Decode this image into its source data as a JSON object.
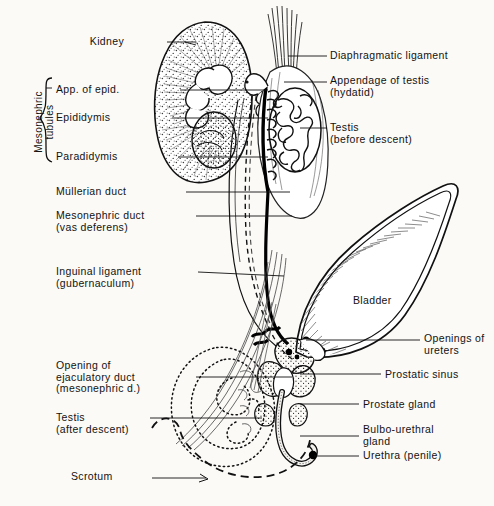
{
  "figure": {
    "background_color": "#fbfaf7",
    "ink_color": "#121212"
  },
  "group_labels": [
    {
      "name": "mesonephric-tubules-group",
      "text": "Mesonephric\ntubules",
      "x": 16,
      "y": 78,
      "orientation": "vertical"
    }
  ],
  "labels_left": [
    {
      "id": "kidney",
      "text": "Kidney",
      "x": 124,
      "y": 38,
      "leader_to_x": 186,
      "leader_to_y": 43
    },
    {
      "id": "app-of-epid",
      "text": "App. of epid.",
      "x": 124,
      "y": 88,
      "leader_to_x": 268,
      "leader_to_y": 90
    },
    {
      "id": "epididymis",
      "text": "Epididymis",
      "x": 124,
      "y": 117,
      "leader_to_x": 268,
      "leader_to_y": 118
    },
    {
      "id": "paradidymis",
      "text": "Paradidymis",
      "x": 124,
      "y": 155,
      "leader_to_x": 268,
      "leader_to_y": 157
    },
    {
      "id": "mullerian-duct",
      "text": "Müllerian duct",
      "x": 124,
      "y": 192,
      "leader_to_x": 289,
      "leader_to_y": 192
    },
    {
      "id": "mesonephric-duct",
      "text": "Mesonephric duct\n(vas deferens)",
      "x": 124,
      "y": 221,
      "leader_to_x": 295,
      "leader_to_y": 221
    },
    {
      "id": "inguinal-ligament",
      "text": "Inguinal ligament\n(gubernaculum)",
      "x": 124,
      "y": 275,
      "leader_to_x": 285,
      "leader_to_y": 277
    },
    {
      "id": "opening-ejac-duct",
      "text": "Opening of\nejaculatory duct\n(mesonephric d.)",
      "x": 124,
      "y": 368,
      "leader_to_x": 288,
      "leader_to_y": 378
    },
    {
      "id": "testis-after",
      "text": "Testis\n(after descent)",
      "x": 124,
      "y": 419,
      "leader_to_x": 212,
      "leader_to_y": 420
    },
    {
      "id": "scrotum",
      "text": "Scrotum",
      "x": 124,
      "y": 476,
      "leader_to_x": 176,
      "leader_to_y": 479
    }
  ],
  "labels_right": [
    {
      "id": "diaphragmatic-ligament",
      "text": "Diaphragmatic ligament",
      "x": 330,
      "y": 57,
      "leader_to_x": 288,
      "leader_to_y": 59
    },
    {
      "id": "appendage-of-testis",
      "text": "Appendage of testis\n(hydatid)",
      "x": 330,
      "y": 81,
      "leader_to_x": 285,
      "leader_to_y": 83
    },
    {
      "id": "testis-before",
      "text": "Testis\n(before descent)",
      "x": 330,
      "y": 128,
      "leader_to_x": 298,
      "leader_to_y": 130
    },
    {
      "id": "openings-of-ureters",
      "text": "Openings of\nureters",
      "x": 424,
      "y": 336,
      "leader_to_x": 315,
      "leader_to_y": 341
    },
    {
      "id": "prostatic-sinus",
      "text": "Prostatic sinus",
      "x": 384,
      "y": 375,
      "leader_to_x": 300,
      "leader_to_y": 375
    },
    {
      "id": "prostate-gland",
      "text": "Prostate gland",
      "x": 362,
      "y": 405,
      "leader_to_x": 302,
      "leader_to_y": 405
    },
    {
      "id": "bulbo-urethral-gland",
      "text": "Bulbo-urethral\ngland",
      "x": 362,
      "y": 423,
      "leader_to_x": 302,
      "leader_to_y": 436
    },
    {
      "id": "urethra-penile",
      "text": "Urethra (penile)",
      "x": 362,
      "y": 455,
      "leader_to_x": 313,
      "leader_to_y": 456
    }
  ],
  "labels_inline": [
    {
      "id": "bladder",
      "text": "Bladder",
      "x": 353,
      "y": 300
    }
  ],
  "structures": [
    {
      "name": "kidney",
      "style": "stippled-bean-outline"
    },
    {
      "name": "mesonephric-tubule-coils",
      "style": "coiled-tubules"
    },
    {
      "name": "testis-before-descent",
      "style": "oval-with-convoluted-tubules"
    },
    {
      "name": "diaphragmatic-ligament",
      "style": "tapered-fiber-bundle"
    },
    {
      "name": "appendage-of-testis-hydatid",
      "style": "small-hook-loop"
    },
    {
      "name": "mullerian-duct",
      "style": "dashed-line"
    },
    {
      "name": "vas-deferens",
      "style": "thick-solid-line"
    },
    {
      "name": "gubernaculum",
      "style": "fiber-strands"
    },
    {
      "name": "bladder",
      "style": "pointed-oval-hatched"
    },
    {
      "name": "ureter-openings",
      "style": "filled-dots"
    },
    {
      "name": "prostate-gland",
      "style": "stippled-lobes"
    },
    {
      "name": "bulbo-urethral-gland",
      "style": "small-stippled-lobes"
    },
    {
      "name": "penile-urethra",
      "style": "curved-stippled-tube"
    },
    {
      "name": "testis-after-descent",
      "style": "dotted-outline"
    },
    {
      "name": "scrotum",
      "style": "dashed-outline"
    }
  ]
}
